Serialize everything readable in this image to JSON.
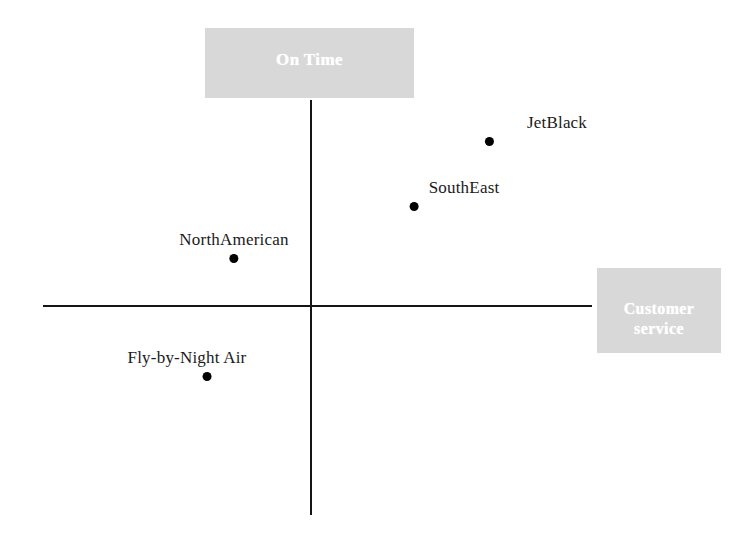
{
  "chart_data": {
    "type": "scatter",
    "title": "",
    "subtitle": "",
    "xlabel": "Customer service",
    "ylabel": "On Time",
    "xlim": [
      -1,
      1
    ],
    "ylim": [
      -1,
      1
    ],
    "grid": false,
    "legend": "none",
    "axes_style": "quadrant-cross",
    "annotations": [],
    "points": [
      {
        "label": "JetBlack",
        "x": 0.45,
        "y": 0.63
      },
      {
        "label": "SouthEast",
        "x": 0.23,
        "y": 0.37
      },
      {
        "label": "NorthAmerican",
        "x": -0.21,
        "y": 0.15
      },
      {
        "label": "Fly-by-Night Air",
        "x": -0.28,
        "y": -0.31
      }
    ],
    "categories": [
      "JetBlack",
      "SouthEast",
      "NorthAmerican",
      "Fly-by-Night Air"
    ],
    "series": [
      {
        "name": "Customer service",
        "values": [
          0.45,
          0.23,
          -0.21,
          -0.28
        ]
      },
      {
        "name": "On Time",
        "values": [
          0.63,
          0.37,
          0.15,
          -0.31
        ]
      }
    ]
  },
  "axes": {
    "vertical": {
      "plate_label": "On Time"
    },
    "horizontal": {
      "plate_label_line1": "Customer",
      "plate_label_line2": "service"
    }
  },
  "brands": [
    {
      "label": "JetBlack"
    },
    {
      "label": "SouthEast"
    },
    {
      "label": "NorthAmerican"
    },
    {
      "label": "Fly-by-Night Air"
    }
  ],
  "colors": {
    "axis": "#151515",
    "plate_background": "#d8d8d8",
    "plate_text": "#ffffff",
    "point": "#000000",
    "label_text": "#1a1a1a",
    "canvas": "#ffffff"
  }
}
